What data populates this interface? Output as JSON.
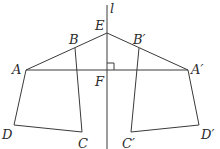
{
  "figure": {
    "axis_label": "l",
    "points": {
      "A": {
        "label": "A",
        "x": 26,
        "y": 70
      },
      "B": {
        "label": "B",
        "x": 75,
        "y": 48
      },
      "C": {
        "label": "C",
        "x": 82,
        "y": 132
      },
      "D": {
        "label": "D",
        "x": 14,
        "y": 125
      },
      "E": {
        "label": "E",
        "x": 107,
        "y": 33
      },
      "F": {
        "label": "F",
        "x": 107,
        "y": 70
      },
      "A2": {
        "label": "A′",
        "x": 188,
        "y": 70
      },
      "B2": {
        "label": "B′",
        "x": 139,
        "y": 48
      },
      "C2": {
        "label": "C′",
        "x": 131,
        "y": 132
      },
      "D2": {
        "label": "D′",
        "x": 199,
        "y": 125
      }
    },
    "right_angle_marker_at": "F",
    "line_color": "#3a3a3a"
  }
}
